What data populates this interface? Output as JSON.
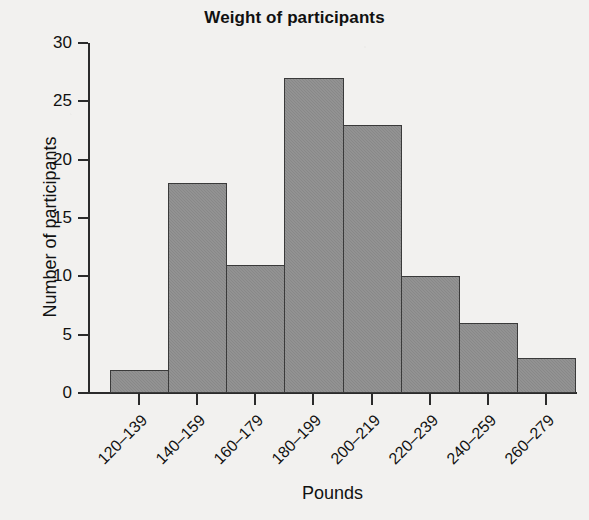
{
  "chart_data": {
    "type": "bar",
    "title": "Weight of participants",
    "xlabel": "Pounds",
    "ylabel": "Number of participants",
    "categories": [
      "120–139",
      "140–159",
      "160–179",
      "180–199",
      "200–219",
      "220–239",
      "240–259",
      "260–279"
    ],
    "values": [
      2,
      18,
      11,
      27,
      23,
      10,
      6,
      3
    ],
    "ylim": [
      0,
      30
    ],
    "yticks": [
      0,
      5,
      10,
      15,
      20,
      25,
      30
    ],
    "ytick_labels": [
      "0",
      "5",
      "10",
      "15",
      "20",
      "25",
      "30"
    ],
    "grid": false,
    "legend": null,
    "bar_fill_color": "#8d8d8d",
    "bar_edge_color": "#3a3a3a",
    "background_color": "#f2f1ef",
    "axis_color": "#2b2b2b"
  }
}
